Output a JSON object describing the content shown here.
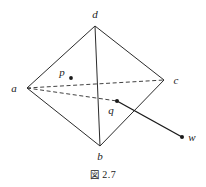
{
  "figure": {
    "caption_symbol": "図",
    "caption_number": "2.7",
    "stroke_color": "#2b2b2b",
    "label_color": "#1a1a1a",
    "background_color": "#ffffff"
  },
  "diagram": {
    "type": "tetrahedron-with-interior-points",
    "vertices": [
      {
        "id": "a",
        "label": "a",
        "x": 27,
        "y": 88,
        "label_x": 14,
        "label_y": 92
      },
      {
        "id": "d",
        "label": "d",
        "x": 95,
        "y": 26,
        "label_x": 95,
        "label_y": 18
      },
      {
        "id": "c",
        "label": "c",
        "x": 164,
        "y": 80,
        "label_x": 176,
        "label_y": 84
      },
      {
        "id": "b",
        "label": "b",
        "x": 100,
        "y": 146,
        "label_x": 100,
        "label_y": 160
      }
    ],
    "points": [
      {
        "id": "p",
        "label": "p",
        "x": 71,
        "y": 78,
        "label_x": 62,
        "label_y": 76
      },
      {
        "id": "q",
        "label": "q",
        "x": 117,
        "y": 101,
        "label_x": 111,
        "label_y": 114
      },
      {
        "id": "w",
        "label": "w",
        "x": 182,
        "y": 137,
        "label_x": 192,
        "label_y": 141
      }
    ],
    "solid_edges": [
      {
        "from": "a",
        "to": "d"
      },
      {
        "from": "d",
        "to": "c"
      },
      {
        "from": "c",
        "to": "b"
      },
      {
        "from": "b",
        "to": "a"
      },
      {
        "from": "d",
        "to": "b"
      }
    ],
    "dashed_edges": [
      {
        "from": "a",
        "to": "c"
      },
      {
        "from": "a",
        "to": "q"
      }
    ],
    "rays": [
      {
        "from": "q",
        "to": "w",
        "style": "solid"
      }
    ]
  }
}
